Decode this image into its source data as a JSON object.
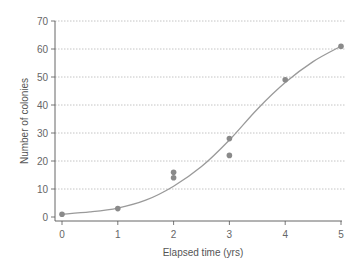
{
  "chart_data": {
    "type": "scatter",
    "title": "",
    "xlabel": "Elapsed time (yrs)",
    "ylabel": "Number of colonies",
    "xlim": [
      0,
      5
    ],
    "ylim": [
      0,
      70
    ],
    "x_ticks": [
      0,
      1,
      2,
      3,
      4,
      5
    ],
    "y_ticks": [
      0,
      10,
      20,
      30,
      40,
      50,
      60,
      70
    ],
    "grid": {
      "horizontal": true,
      "style": "dotted"
    },
    "legend": null,
    "series": [
      {
        "name": "Observed colonies",
        "kind": "points",
        "x": [
          0,
          1,
          2,
          2,
          3,
          3,
          4,
          5
        ],
        "y": [
          1,
          3,
          16,
          14,
          28,
          22,
          49,
          61
        ]
      },
      {
        "name": "Logistic fit",
        "kind": "curve",
        "x": [
          0,
          0.5,
          1,
          1.5,
          2,
          2.5,
          3,
          3.5,
          4,
          4.5,
          5
        ],
        "y": [
          1,
          1.8,
          3.2,
          6,
          11,
          18,
          27.5,
          38.5,
          48,
          55.5,
          61
        ]
      }
    ]
  },
  "colors": {
    "points": "#8a8a8a",
    "curve": "#9a9a9a",
    "axis": "#555555",
    "grid": "#b5b5b5"
  }
}
